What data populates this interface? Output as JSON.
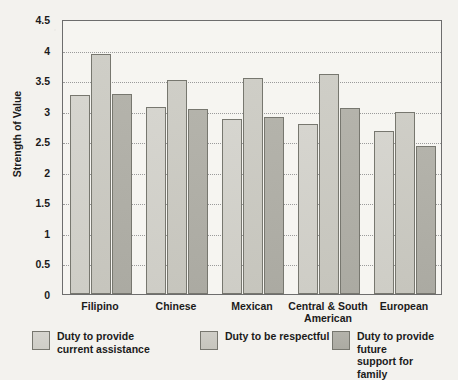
{
  "chart_data": {
    "type": "bar",
    "title": "",
    "xlabel": "",
    "ylabel": "Strength of Value",
    "ylim": [
      0,
      4.5
    ],
    "ytick_step": 0.5,
    "yticks": [
      "4.5",
      "4",
      "3.5",
      "3",
      "2.5",
      "2",
      "1.5",
      "1",
      "0.5",
      "0"
    ],
    "grid": "horizontal-dotted",
    "legend_position": "below",
    "categories": [
      "Filipino",
      "Chinese",
      "Mexican",
      "Central & South American",
      "European"
    ],
    "series": [
      {
        "name": "Duty to provide current assistance",
        "color": "#d2d1ca",
        "values": [
          3.25,
          3.06,
          2.87,
          2.78,
          2.67
        ]
      },
      {
        "name": "Duty to be respectful",
        "color": "#cacac2",
        "values": [
          3.93,
          3.5,
          3.54,
          3.6,
          2.98
        ]
      },
      {
        "name": "Duty to provide future support for family",
        "color": "#b0afa7",
        "values": [
          3.28,
          3.03,
          2.9,
          3.05,
          2.42
        ]
      }
    ]
  },
  "axis": {
    "y_title": "Strength of Value"
  },
  "legend": {
    "items": [
      "Duty to provide\ncurrent assistance",
      "Duty to be respectful",
      "Duty to provide future\nsupport for family"
    ]
  },
  "colors": {
    "frame": "#6d6d6d",
    "gridline": "#9a9a9a",
    "background": "#f3f2ee",
    "plot_background": "#f6f5f1",
    "text": "#1b1b1b"
  }
}
